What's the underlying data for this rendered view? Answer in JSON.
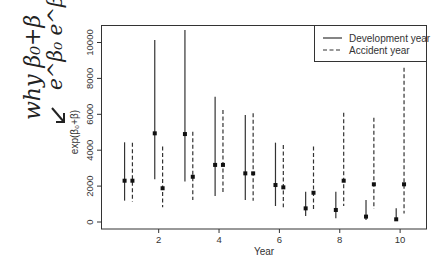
{
  "chart_data": {
    "type": "errorbar",
    "title": "",
    "xlabel": "Year",
    "ylabel": "exp(β₀+β)",
    "xlim": [
      0.5,
      10.8
    ],
    "ylim": [
      0,
      10800
    ],
    "x_ticks": [
      2,
      4,
      6,
      8,
      10
    ],
    "x_tick_labels": [
      "2",
      "4",
      "6",
      "8",
      "10"
    ],
    "y_ticks": [
      0,
      2000,
      4000,
      6000,
      8000,
      10000
    ],
    "y_tick_labels": [
      "0",
      "2000",
      "4000",
      "6000",
      "8000",
      "10000"
    ],
    "grid": false,
    "legend": {
      "placement": "top-right",
      "entries": [
        {
          "label": "Development year",
          "style": "solid"
        },
        {
          "label": "Accident year",
          "style": "dashed"
        }
      ]
    },
    "series": [
      {
        "name": "Development year",
        "style": "solid",
        "x_offset": -0.13,
        "x": [
          1,
          2,
          3,
          4,
          5,
          6,
          7,
          8,
          9,
          10
        ],
        "estimate": [
          2300,
          4940,
          4900,
          3180,
          2710,
          2060,
          760,
          670,
          300,
          150
        ],
        "lower": [
          1190,
          2380,
          2250,
          1450,
          1230,
          890,
          330,
          210,
          110,
          60
        ],
        "upper": [
          4440,
          10140,
          10700,
          6980,
          5960,
          4420,
          1690,
          1690,
          1230,
          760
        ]
      },
      {
        "name": "Accident year",
        "style": "dashed",
        "x_offset": 0.13,
        "x": [
          1,
          2,
          3,
          4,
          5,
          6,
          7,
          8,
          9,
          10
        ],
        "estimate": [
          2300,
          1880,
          2520,
          3180,
          2710,
          1930,
          1630,
          2300,
          2100,
          2100
        ],
        "lower": [
          1130,
          820,
          1230,
          1600,
          1190,
          820,
          610,
          890,
          720,
          480
        ],
        "upper": [
          4420,
          4200,
          5030,
          6240,
          6060,
          4290,
          4200,
          6090,
          5810,
          8600
        ]
      }
    ]
  },
  "annotations": {
    "handwritten_line1": "why β₀+β",
    "handwritten_line2": "e^β₀ e^β",
    "arrow": "arrow pointing to y-axis label"
  }
}
